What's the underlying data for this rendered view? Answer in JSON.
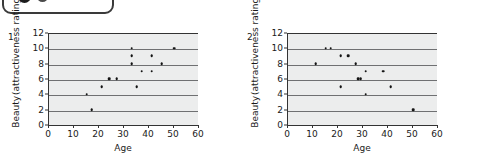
{
  "badge": {
    "name": "cropped-toolbar-pill",
    "dots": [
      "filled-circle-large",
      "filled-circle-small"
    ]
  },
  "chart_data": [
    {
      "type": "scatter",
      "panel_label": "1",
      "title": "",
      "xlabel": "Age",
      "ylabel_line1": "Beauty",
      "ylabel_line2": "(attractiveness rating)",
      "xlim": [
        0,
        60
      ],
      "ylim": [
        0,
        12
      ],
      "xticks": [
        0,
        10,
        20,
        30,
        40,
        50,
        60
      ],
      "yticks": [
        0,
        2,
        4,
        6,
        8,
        10,
        12
      ],
      "grid": "horizontal",
      "legend": "none",
      "points": [
        {
          "x": 15,
          "y": 4
        },
        {
          "x": 17,
          "y": 2
        },
        {
          "x": 21,
          "y": 5
        },
        {
          "x": 24,
          "y": 6
        },
        {
          "x": 27,
          "y": 6
        },
        {
          "x": 33,
          "y": 8
        },
        {
          "x": 33,
          "y": 9
        },
        {
          "x": 33,
          "y": 10
        },
        {
          "x": 35,
          "y": 5
        },
        {
          "x": 37,
          "y": 7
        },
        {
          "x": 41,
          "y": 7
        },
        {
          "x": 41,
          "y": 9
        },
        {
          "x": 45,
          "y": 8
        },
        {
          "x": 50,
          "y": 10
        }
      ]
    },
    {
      "type": "scatter",
      "panel_label": "2",
      "title": "",
      "xlabel": "Age",
      "ylabel_line1": "Beauty",
      "ylabel_line2": "(attractiveness rating)",
      "xlim": [
        0,
        60
      ],
      "ylim": [
        0,
        12
      ],
      "xticks": [
        0,
        10,
        20,
        30,
        40,
        50,
        60
      ],
      "yticks": [
        0,
        2,
        4,
        6,
        8,
        10,
        12
      ],
      "grid": "horizontal",
      "legend": "none",
      "points": [
        {
          "x": 11,
          "y": 8
        },
        {
          "x": 15,
          "y": 10
        },
        {
          "x": 17,
          "y": 10
        },
        {
          "x": 21,
          "y": 9
        },
        {
          "x": 21,
          "y": 5
        },
        {
          "x": 24,
          "y": 9
        },
        {
          "x": 27,
          "y": 8
        },
        {
          "x": 28,
          "y": 6
        },
        {
          "x": 29,
          "y": 6
        },
        {
          "x": 31,
          "y": 7
        },
        {
          "x": 31,
          "y": 4
        },
        {
          "x": 38,
          "y": 7
        },
        {
          "x": 41,
          "y": 5
        },
        {
          "x": 50,
          "y": 2
        }
      ]
    }
  ],
  "colors": {
    "plot_background": "#eceded",
    "gridline": "#6f7072",
    "axis": "#333333",
    "point": "#141414",
    "text": "#1a1a1a",
    "badge_outline": "#3a3a3a"
  }
}
